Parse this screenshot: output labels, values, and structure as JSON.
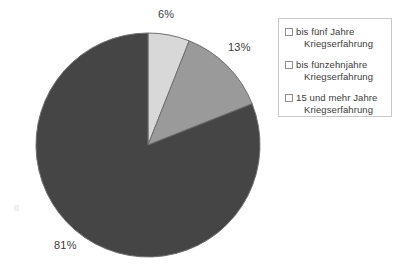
{
  "chart_data": {
    "type": "pie",
    "title": "",
    "xlabel": "",
    "ylabel": "",
    "unit": "%",
    "grid": false,
    "legend_position": "right",
    "start_angle": 90,
    "direction": "clockwise",
    "categories": [
      "bis fünf Jahre Kriegserfahrung",
      "bis fünzehnjahre Kriegserfahrung",
      "15 und mehr Jahre Kriegserfahrung"
    ],
    "values": [
      6,
      13,
      81
    ],
    "data_labels": [
      "6%",
      "13%",
      "81%"
    ],
    "colors": [
      "#d8d8d8",
      "#9a9a9a",
      "#454545"
    ]
  },
  "pie": {
    "center_x": 148,
    "center_y": 145,
    "radius": 112,
    "stroke_color": "#6f6f6f",
    "slices": [
      {
        "label": "6%",
        "value": 6,
        "color": "#d8d8d8"
      },
      {
        "label": "13%",
        "value": 13,
        "color": "#9a9a9a"
      },
      {
        "label": "81%",
        "value": 81,
        "color": "#454545"
      }
    ]
  },
  "legend": {
    "border_color": "#c9c9c9",
    "items": [
      {
        "swatch_color": "#d8d8d8",
        "line1": "bis fünf Jahre",
        "line2": "Kriegserfahrung"
      },
      {
        "swatch_color": "#9a9a9a",
        "line1": "bis fünzehnjahre",
        "line2": "Kriegserfahrung"
      },
      {
        "swatch_color": "#454545",
        "line1": "15 und mehr Jahre",
        "line2": "Kriegserfahrung"
      }
    ]
  }
}
